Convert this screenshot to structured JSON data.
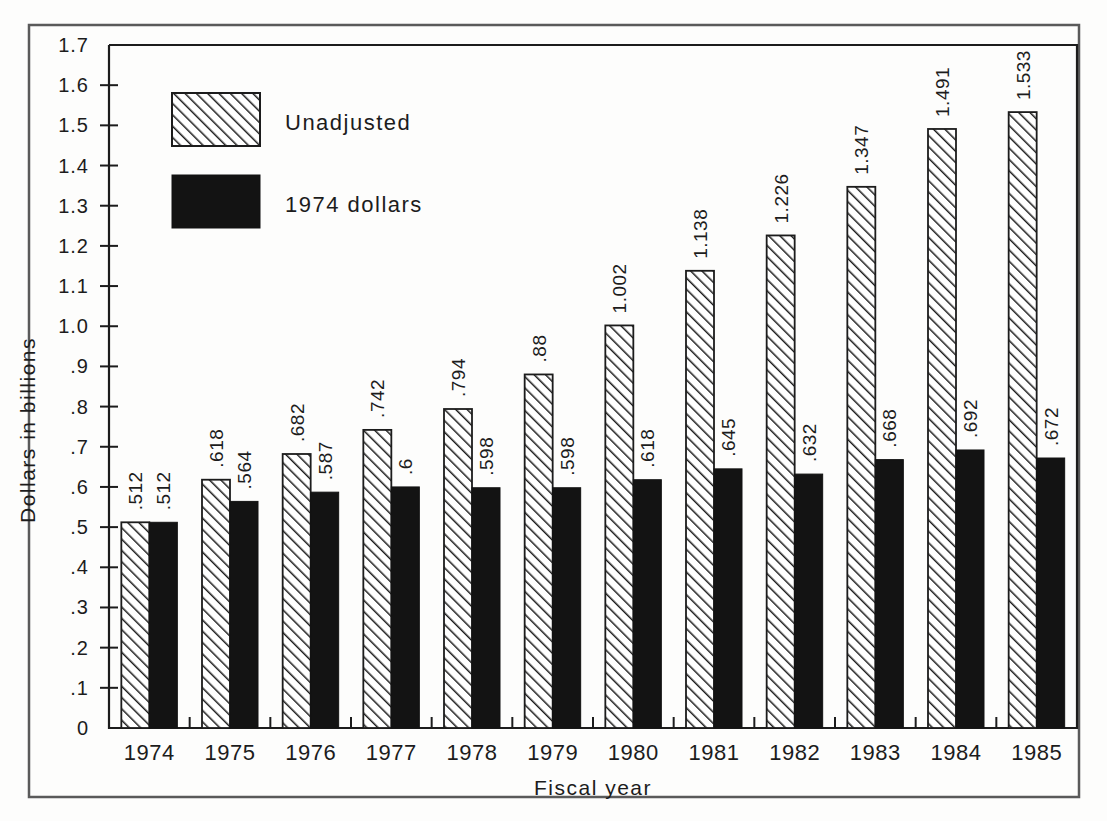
{
  "chart_data": {
    "type": "bar",
    "title": "",
    "xlabel": "Fiscal year",
    "ylabel": "Dollars in billions",
    "categories": [
      "1974",
      "1975",
      "1976",
      "1977",
      "1978",
      "1979",
      "1980",
      "1981",
      "1982",
      "1983",
      "1984",
      "1985"
    ],
    "series": [
      {
        "name": "Unadjusted",
        "style": "hatched",
        "color": "#ffffff",
        "values": [
          0.512,
          0.618,
          0.682,
          0.742,
          0.794,
          0.88,
          1.002,
          1.138,
          1.226,
          1.347,
          1.491,
          1.533
        ],
        "labels": [
          ".512",
          ".618",
          ".682",
          ".742",
          ".794",
          ".88",
          "1.002",
          "1.138",
          "1.226",
          "1.347",
          "1.491",
          "1.533"
        ]
      },
      {
        "name": "1974 dollars",
        "style": "solid",
        "color": "#131313",
        "values": [
          0.512,
          0.564,
          0.587,
          0.6,
          0.598,
          0.598,
          0.618,
          0.645,
          0.632,
          0.668,
          0.692,
          0.672
        ],
        "labels": [
          ".512",
          ".564",
          ".587",
          ".6",
          ".598",
          ".598",
          ".618",
          ".645",
          ".632",
          ".668",
          ".692",
          ".672"
        ]
      }
    ],
    "ylim": [
      0,
      1.7
    ],
    "ytick_values": [
      0,
      0.1,
      0.2,
      0.3,
      0.4,
      0.5,
      0.6,
      0.7,
      0.8,
      0.9,
      1.0,
      1.1,
      1.2,
      1.3,
      1.4,
      1.5,
      1.6,
      1.7
    ],
    "ytick_labels": [
      "0",
      ".1",
      ".2",
      ".3",
      ".4",
      ".5",
      ".6",
      ".7",
      ".8",
      ".9",
      "1.0",
      "1.1",
      "1.2",
      "1.3",
      "1.4",
      "1.5",
      "1.6",
      "1.7"
    ],
    "grid": false,
    "legend_position": "upper-left-inside"
  },
  "legend": {
    "entries": [
      {
        "label": "Unadjusted",
        "swatch": "hatched"
      },
      {
        "label": "1974 dollars",
        "swatch": "solid"
      }
    ]
  },
  "colors": {
    "ink": "#1c1c1c",
    "solid_bar": "#131313",
    "background": "#fdfdfc",
    "frame": "#555555"
  }
}
